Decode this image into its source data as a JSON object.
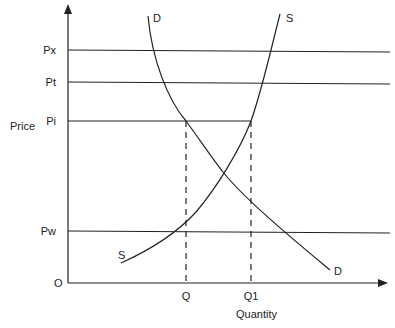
{
  "diagram": {
    "type": "supply-demand",
    "axes": {
      "y_label": "Price",
      "x_label": "Quantity",
      "origin_label": "O"
    },
    "price_levels": [
      {
        "id": "px",
        "label": "Px"
      },
      {
        "id": "pt",
        "label": "Pt"
      },
      {
        "id": "pi",
        "label": "Pi"
      },
      {
        "id": "pw",
        "label": "Pw"
      }
    ],
    "quantity_marks": [
      {
        "id": "q",
        "label": "Q"
      },
      {
        "id": "q1",
        "label": "Q1"
      }
    ],
    "curves": [
      {
        "id": "demand",
        "label_top": "D",
        "label_bottom": "D"
      },
      {
        "id": "supply",
        "label_top": "S",
        "label_bottom": "S"
      }
    ]
  }
}
